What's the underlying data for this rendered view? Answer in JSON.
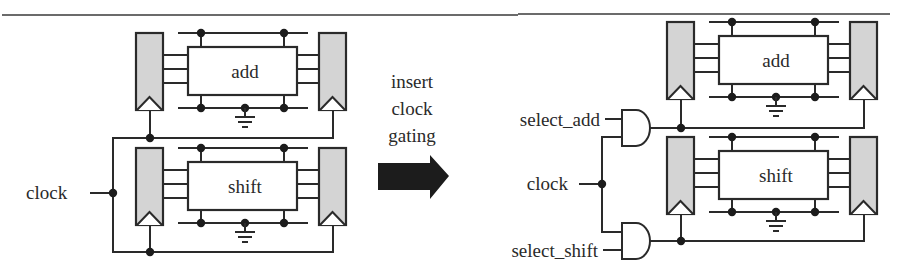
{
  "figure": {
    "left_circuit": {
      "top_block_label": "add",
      "bottom_block_label": "shift",
      "clock_label": "clock"
    },
    "transform": {
      "label_lines": [
        "insert",
        "clock",
        "gating"
      ]
    },
    "right_circuit": {
      "top_block_label": "add",
      "bottom_block_label": "shift",
      "clock_label": "clock",
      "select_add_label": "select_add",
      "select_shift_label": "select_shift"
    },
    "colors": {
      "line": "#2a2a2a",
      "register_fill": "#d4d4d4",
      "arrow_fill": "#1c1c1c"
    }
  }
}
